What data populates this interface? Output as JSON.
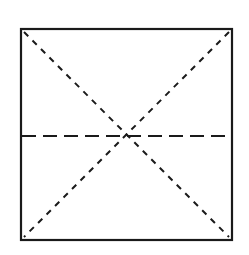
{
  "diagram": {
    "colors": {
      "background": "#ffffff",
      "stroke": "#1a1a1a"
    },
    "square": {
      "x": 21,
      "y": 29,
      "width": 211,
      "height": 211,
      "stroke_width": 2.2
    },
    "diagonals": [
      {
        "name": "diagonal-top-left-to-bottom-right",
        "x1": 24,
        "y1": 32,
        "x2": 229,
        "y2": 237,
        "dash": "6 6"
      },
      {
        "name": "diagonal-top-right-to-bottom-left",
        "x1": 229,
        "y1": 32,
        "x2": 24,
        "y2": 237,
        "dash": "6 6"
      }
    ],
    "midline": {
      "name": "horizontal-midline",
      "x1": 22,
      "y1": 136,
      "x2": 231,
      "y2": 136,
      "dash": "14 7"
    }
  }
}
